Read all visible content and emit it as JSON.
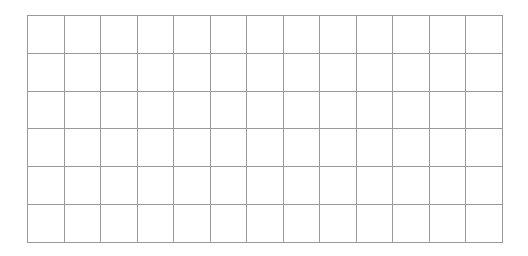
{
  "grid": {
    "rows": 6,
    "columns": 13,
    "line_color": "#9a9a9a",
    "background_color": "#ffffff",
    "cells": []
  }
}
